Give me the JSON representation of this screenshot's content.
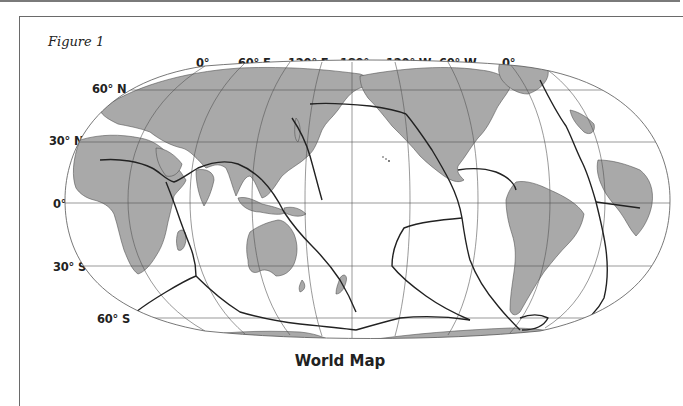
{
  "figure": {
    "label": "Figure 1",
    "title": "World Map",
    "projection": "pseudo-cylindrical (Robinson-style), centered on 180°",
    "features": [
      "continents (gray fill)",
      "tectonic plate boundaries (bold lines)",
      "graticule (thin lines)"
    ]
  },
  "longitude_labels": [
    "0°",
    "60° E",
    "120° E",
    "180°",
    "120° W",
    "60° W",
    "0°"
  ],
  "latitude_labels": [
    "60° N",
    "30° N",
    "0°",
    "30° S",
    "60° S"
  ],
  "colors": {
    "land": "#a9a9a9",
    "ocean": "#ffffff",
    "plate_boundary": "#2a2a2a",
    "graticule": "#555555",
    "frame": "#6a6a6a"
  }
}
